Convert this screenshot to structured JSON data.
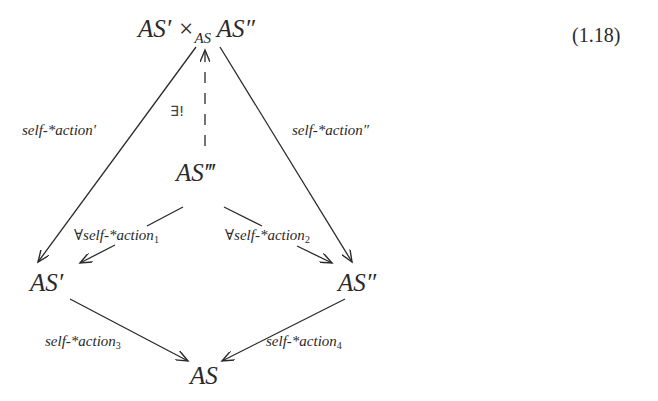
{
  "equation_number": "(1.18)",
  "nodes": {
    "pullback": {
      "left": "AS′ ×",
      "sub": "AS",
      "right": " AS″"
    },
    "as_triple_prime": "AS‴",
    "as_prime": "AS′",
    "as_double_prime": "AS″",
    "as": "AS"
  },
  "edges": {
    "pullback_to_prime": {
      "label": "self-*action′"
    },
    "pullback_to_double_prime": {
      "label": "self-*action″"
    },
    "triple_to_pullback": {
      "label": "∃!",
      "style": "dashed"
    },
    "triple_to_prime": {
      "label": "∀self-*action",
      "sub": "1"
    },
    "triple_to_double_prime": {
      "label": "∀self-*action",
      "sub": "2"
    },
    "prime_to_as": {
      "label": "self-*action",
      "sub": "3"
    },
    "double_prime_to_as": {
      "label": "self-*action",
      "sub": "4"
    }
  },
  "colors": {
    "ink": "#2a2a2a",
    "background": "#ffffff"
  }
}
